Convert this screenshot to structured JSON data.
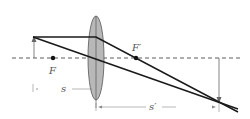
{
  "diagram": {
    "type": "thin-lens ray diagram",
    "labels": {
      "focal_left": "F",
      "focal_right": "F′",
      "object_distance": "s",
      "image_distance": "s′"
    },
    "colors": {
      "ray": "#1a1a1a",
      "lens_fill": "#b8b8b8",
      "lens_stroke": "#555555",
      "axis": "#333333",
      "arrow": "#666666"
    }
  }
}
